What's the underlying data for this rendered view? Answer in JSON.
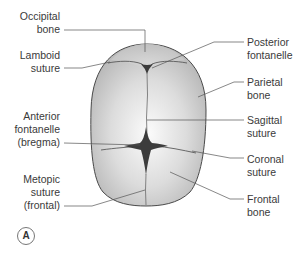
{
  "figure": {
    "panel_label": "A",
    "colors": {
      "bone_fill_light": "#f2f2f2",
      "bone_fill_dark": "#b9b9b9",
      "outline": "#4a4a4a",
      "fontanelle": "#3c3c3c",
      "leader_line": "#555555",
      "text": "#3a3a3a"
    }
  },
  "labels": {
    "occipital_bone": [
      "Occipital",
      "bone"
    ],
    "lamboid_suture": [
      "Lamboid",
      "suture"
    ],
    "anterior_fontanelle": [
      "Anterior",
      "fontanelle",
      "(bregma)"
    ],
    "metopic_suture": [
      "Metopic",
      "suture",
      "(frontal)"
    ],
    "posterior_fontanelle": [
      "Posterior",
      "fontanelle"
    ],
    "parietal_bone": [
      "Parietal",
      "bone"
    ],
    "sagittal_suture": [
      "Sagittal",
      "suture"
    ],
    "coronal_suture": [
      "Coronal",
      "suture"
    ],
    "frontal_bone": [
      "Frontal",
      "bone"
    ]
  }
}
